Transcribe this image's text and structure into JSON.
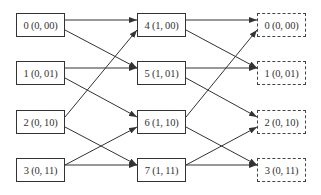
{
  "diagram": {
    "columns": {
      "left": {
        "x": 16,
        "style": "solid",
        "nodes": [
          {
            "id": "L0",
            "label": "0 (0, 00)"
          },
          {
            "id": "L1",
            "label": "1 (0, 01)"
          },
          {
            "id": "L2",
            "label": "2 (0, 10)"
          },
          {
            "id": "L3",
            "label": "3 (0, 11)"
          }
        ]
      },
      "middle": {
        "x": 137,
        "style": "solid",
        "nodes": [
          {
            "id": "M4",
            "label": "4 (1, 00)"
          },
          {
            "id": "M5",
            "label": "5 (1, 01)"
          },
          {
            "id": "M6",
            "label": "6 (1, 10)"
          },
          {
            "id": "M7",
            "label": "7 (1, 11)"
          }
        ]
      },
      "right": {
        "x": 257,
        "style": "dashed",
        "nodes": [
          {
            "id": "R0",
            "label": "0 (0, 00)"
          },
          {
            "id": "R1",
            "label": "1 (0, 01)"
          },
          {
            "id": "R2",
            "label": "2 (0, 10)"
          },
          {
            "id": "R3",
            "label": "3 (0, 11)"
          }
        ]
      }
    },
    "row_tops": [
      13,
      61,
      110,
      158
    ],
    "edges": [
      {
        "from": "L0",
        "to": "M4"
      },
      {
        "from": "L0",
        "to": "M5"
      },
      {
        "from": "L1",
        "to": "M5"
      },
      {
        "from": "L1",
        "to": "M6"
      },
      {
        "from": "L2",
        "to": "M4"
      },
      {
        "from": "L2",
        "to": "M7"
      },
      {
        "from": "L3",
        "to": "M6"
      },
      {
        "from": "L3",
        "to": "M7"
      },
      {
        "from": "M4",
        "to": "R0"
      },
      {
        "from": "M4",
        "to": "R1"
      },
      {
        "from": "M5",
        "to": "R1"
      },
      {
        "from": "M5",
        "to": "R2"
      },
      {
        "from": "M6",
        "to": "R0"
      },
      {
        "from": "M6",
        "to": "R3"
      },
      {
        "from": "M7",
        "to": "R2"
      },
      {
        "from": "M7",
        "to": "R3"
      }
    ],
    "colors": {
      "stroke": "#333333",
      "background": "#ffffff"
    }
  }
}
